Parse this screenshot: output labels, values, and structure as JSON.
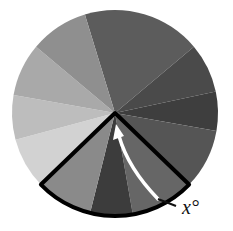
{
  "diagram": {
    "type": "sector-wheel",
    "center": [
      115,
      113
    ],
    "radius": 103,
    "sectors": [
      {
        "start": -107,
        "end": -40,
        "color": "#5c5c5c"
      },
      {
        "start": -40,
        "end": -12,
        "color": "#4a4a4a"
      },
      {
        "start": -12,
        "end": 10,
        "color": "#3e3e3e"
      },
      {
        "start": 10,
        "end": 44,
        "color": "#555555"
      },
      {
        "start": 44,
        "end": 80,
        "color": "#666666"
      },
      {
        "start": 80,
        "end": 104,
        "color": "#3c3c3c"
      },
      {
        "start": 104,
        "end": 136,
        "color": "#8a8a8a"
      },
      {
        "start": 136,
        "end": 165,
        "color": "#d2d2d2"
      },
      {
        "start": 165,
        "end": 190,
        "color": "#bdbdbd"
      },
      {
        "start": 190,
        "end": 220,
        "color": "#a9a9a9"
      },
      {
        "start": 220,
        "end": 253,
        "color": "#8f8f8f"
      }
    ],
    "highlight": {
      "start": 44,
      "end": 136,
      "stroke": "#000000"
    },
    "arrow_color": "#ffffff",
    "angle_label": "x°"
  }
}
